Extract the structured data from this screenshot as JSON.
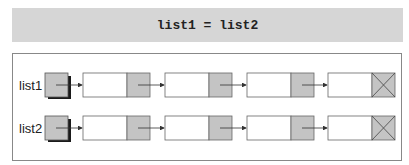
{
  "header": {
    "code": "list1 = list2"
  },
  "lists": [
    {
      "label": "list1",
      "nodes": 4,
      "terminated_with_null": true
    },
    {
      "label": "list2",
      "nodes": 4,
      "terminated_with_null": true
    }
  ],
  "colors": {
    "header_bg": "#d6d6d6",
    "pointer_cell": "#c4c4c4",
    "shadow": "#1a1a1a",
    "line": "#555555"
  }
}
